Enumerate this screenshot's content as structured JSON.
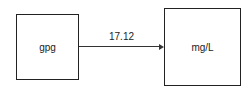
{
  "diagram": {
    "nodes": [
      {
        "id": "source",
        "label": "gpg"
      },
      {
        "id": "target",
        "label": "mg/L"
      }
    ],
    "edges": [
      {
        "from": "source",
        "to": "target",
        "label": "17.12"
      }
    ]
  }
}
